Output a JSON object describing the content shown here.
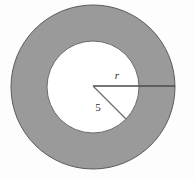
{
  "figure": {
    "name": "annulus-with-radii",
    "background_color": "#fdfdfd"
  },
  "chart_data": {
    "type": "diagram",
    "title": "",
    "shapes": [
      {
        "name": "outer-circle",
        "kind": "circle",
        "cx": 93,
        "cy": 87,
        "r": 82,
        "fill": "#9a9a9a",
        "stroke": "#5c5c5c",
        "stroke_width": 1
      },
      {
        "name": "inner-circle",
        "kind": "circle",
        "cx": 93,
        "cy": 87,
        "r": 46,
        "fill": "#ffffff",
        "stroke": "#6b6b6b",
        "stroke_width": 1
      }
    ],
    "segments": [
      {
        "name": "outer-radius-segment",
        "label": "r",
        "from": [
          93,
          86
        ],
        "to": [
          175,
          86
        ],
        "stroke": "#4a4a4a",
        "stroke_width": 1.4
      },
      {
        "name": "inner-radius-segment",
        "label": "5",
        "from": [
          93,
          86
        ],
        "to": [
          126,
          119
        ],
        "stroke": "#6e6e6e",
        "stroke_width": 1.2
      }
    ],
    "labels": [
      {
        "name": "outer-radius-label",
        "text": "r",
        "x": 117,
        "y": 79,
        "italic": true
      },
      {
        "name": "inner-radius-label",
        "text": "5",
        "x": 98,
        "y": 111,
        "italic": false
      }
    ],
    "colors": {
      "annulus_fill": "#9a9a9a",
      "inner_fill": "#ffffff",
      "outline": "#5c5c5c",
      "line": "#4a4a4a",
      "text": "#2b2b2b"
    }
  }
}
